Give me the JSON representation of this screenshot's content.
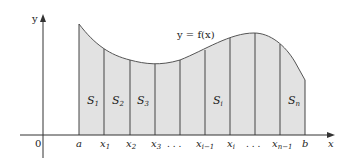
{
  "diagram": {
    "curve_label": "y = f(x)",
    "axes": {
      "x_label": "x",
      "y_label": "y",
      "origin_label": "0"
    },
    "x_ticks": [
      {
        "main": "a",
        "sub": ""
      },
      {
        "main": "x",
        "sub": "1"
      },
      {
        "main": "x",
        "sub": "2"
      },
      {
        "main": "x",
        "sub": "3"
      },
      {
        "main": ". . .",
        "sub": ""
      },
      {
        "main": "x",
        "sub": "i−1"
      },
      {
        "main": "x",
        "sub": "i"
      },
      {
        "main": ". . .",
        "sub": ""
      },
      {
        "main": "x",
        "sub": "n−1"
      },
      {
        "main": "b",
        "sub": ""
      }
    ],
    "strips": [
      {
        "main": "S",
        "sub": "1"
      },
      {
        "main": "S",
        "sub": "2"
      },
      {
        "main": "S",
        "sub": "3"
      },
      {
        "main": "S",
        "sub": "i"
      },
      {
        "main": "S",
        "sub": "n"
      }
    ],
    "colors": {
      "fill": "#e2e2e2",
      "lines": "#444444",
      "curve": "#555555"
    }
  }
}
